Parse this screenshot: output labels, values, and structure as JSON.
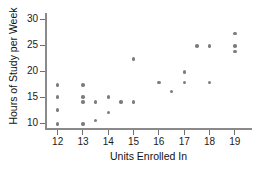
{
  "chart_data": {
    "type": "scatter",
    "title": "",
    "xlabel": "Units Enrolled In",
    "ylabel": "Hours of Study per Week",
    "xlim": [
      11.5,
      19.6
    ],
    "ylim": [
      9.0,
      30.8
    ],
    "xticks": [
      12,
      13,
      14,
      15,
      16,
      17,
      18,
      19
    ],
    "yticks": [
      10,
      15,
      20,
      25,
      30
    ],
    "xtick_labels": [
      "12",
      "13",
      "14",
      "15",
      "16",
      "17",
      "18",
      "19"
    ],
    "ytick_labels": [
      "10",
      "15",
      "20",
      "25",
      "30"
    ],
    "grid": false,
    "legend": false,
    "marker_color": "#7d7d7d",
    "axis_color": "#8a8a8a",
    "points": [
      {
        "x": 12,
        "y": 17.3
      },
      {
        "x": 12,
        "y": 15.0
      },
      {
        "x": 12,
        "y": 12.5
      },
      {
        "x": 12,
        "y": 9.8
      },
      {
        "x": 13,
        "y": 17.3
      },
      {
        "x": 13,
        "y": 15.0
      },
      {
        "x": 13,
        "y": 14.0
      },
      {
        "x": 13,
        "y": 9.8
      },
      {
        "x": 13.5,
        "y": 14.0
      },
      {
        "x": 13.5,
        "y": 10.4
      },
      {
        "x": 14,
        "y": 15.0
      },
      {
        "x": 14,
        "y": 12.0
      },
      {
        "x": 14.5,
        "y": 14.0
      },
      {
        "x": 15,
        "y": 22.3
      },
      {
        "x": 15,
        "y": 14.0
      },
      {
        "x": 16,
        "y": 17.8
      },
      {
        "x": 16.5,
        "y": 16.0
      },
      {
        "x": 17,
        "y": 19.8
      },
      {
        "x": 17,
        "y": 17.8
      },
      {
        "x": 17.5,
        "y": 24.8
      },
      {
        "x": 18,
        "y": 24.8
      },
      {
        "x": 18,
        "y": 17.8
      },
      {
        "x": 19,
        "y": 27.2
      },
      {
        "x": 19,
        "y": 24.8
      },
      {
        "x": 19,
        "y": 23.8
      }
    ]
  }
}
